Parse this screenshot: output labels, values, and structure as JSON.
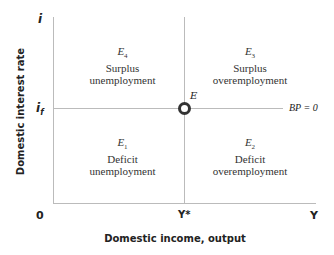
{
  "axes": {
    "y_title": "Domestic interest rate",
    "x_title": "Domestic income, output",
    "y_top_label": "i",
    "y_ref_label": "i",
    "y_ref_sub": "f",
    "origin_label": "0",
    "x_ref_label": "Y*",
    "x_end_label": "Y"
  },
  "lines": {
    "horizontal_label": "BP = 0",
    "point_label": "E"
  },
  "regions": [
    {
      "id": "E4",
      "eq": "E",
      "sub": "4",
      "line1": "Surplus",
      "line2": "unemployment"
    },
    {
      "id": "E3",
      "eq": "E",
      "sub": "3",
      "line1": "Surplus",
      "line2": "overemployment"
    },
    {
      "id": "E1",
      "eq": "E",
      "sub": "1",
      "line1": "Deficit",
      "line2": "unemployment"
    },
    {
      "id": "E2",
      "eq": "E",
      "sub": "2",
      "line1": "Deficit",
      "line2": "overemployment"
    }
  ],
  "colors": {
    "axis": "#b8b8b8",
    "text": "#222222",
    "point": "#333333"
  }
}
